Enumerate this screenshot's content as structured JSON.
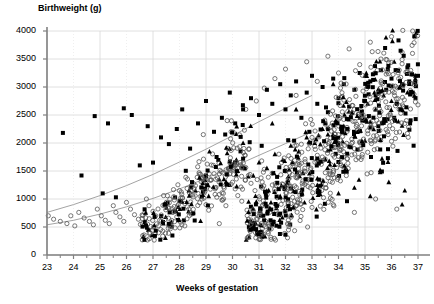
{
  "chart_data": {
    "type": "scatter",
    "title": "",
    "xlabel": "Weeks of gestation",
    "ylabel": "Birthweight (g)",
    "xlim": [
      23,
      37
    ],
    "ylim": [
      0,
      4000
    ],
    "xticks": [
      23,
      24,
      25,
      26,
      27,
      28,
      29,
      30,
      31,
      32,
      33,
      34,
      35,
      36,
      37
    ],
    "yticks": [
      0,
      500,
      1000,
      1500,
      2000,
      2500,
      3000,
      3500,
      4000
    ],
    "grid": true,
    "legend_position": "none",
    "series": [
      {
        "name": "open-circles",
        "marker": "open-circle",
        "color": "#555555",
        "points": [
          [
            23.05,
            700
          ],
          [
            23.25,
            640
          ],
          [
            23.5,
            600
          ],
          [
            23.75,
            560
          ],
          [
            23.9,
            700
          ],
          [
            24.05,
            520
          ],
          [
            24.2,
            760
          ],
          [
            24.4,
            660
          ],
          [
            24.6,
            600
          ],
          [
            24.75,
            540
          ],
          [
            24.9,
            820
          ],
          [
            25.05,
            700
          ],
          [
            25.2,
            620
          ],
          [
            25.35,
            560
          ],
          [
            25.5,
            880
          ],
          [
            25.6,
            760
          ],
          [
            25.75,
            680
          ],
          [
            25.9,
            600
          ],
          [
            26.0,
            940
          ],
          [
            26.15,
            820
          ],
          [
            26.3,
            720
          ],
          [
            26.45,
            640
          ],
          [
            26.6,
            560
          ],
          [
            26.75,
            1000
          ],
          [
            26.85,
            880
          ],
          [
            27.0,
            780
          ],
          [
            27.1,
            700
          ],
          [
            27.25,
            620
          ],
          [
            27.4,
            1060
          ],
          [
            27.5,
            940
          ],
          [
            27.6,
            840
          ],
          [
            27.75,
            760
          ],
          [
            27.9,
            680
          ],
          [
            28.0,
            1150
          ],
          [
            28.1,
            1020
          ],
          [
            28.2,
            920
          ],
          [
            28.35,
            820
          ],
          [
            28.5,
            740
          ],
          [
            28.6,
            1240
          ],
          [
            28.7,
            1100
          ],
          [
            28.85,
            1000
          ],
          [
            29.0,
            900
          ],
          [
            29.1,
            800
          ],
          [
            29.2,
            1340
          ],
          [
            29.35,
            1200
          ],
          [
            29.5,
            1080
          ],
          [
            29.6,
            980
          ],
          [
            29.75,
            880
          ],
          [
            29.9,
            1450
          ],
          [
            30.0,
            1300
          ],
          [
            30.1,
            1180
          ],
          [
            30.2,
            1060
          ],
          [
            30.35,
            960
          ],
          [
            30.5,
            1560
          ],
          [
            30.6,
            1420
          ],
          [
            30.7,
            1280
          ],
          [
            30.85,
            1150
          ],
          [
            31.0,
            1040
          ],
          [
            31.1,
            1680
          ],
          [
            31.2,
            1530
          ],
          [
            31.35,
            1390
          ],
          [
            31.5,
            1250
          ],
          [
            31.6,
            1130
          ],
          [
            31.75,
            1800
          ],
          [
            31.85,
            1650
          ],
          [
            32.0,
            1500
          ],
          [
            32.1,
            1360
          ],
          [
            32.2,
            1230
          ],
          [
            32.35,
            1950
          ],
          [
            32.5,
            1790
          ],
          [
            32.6,
            1640
          ],
          [
            32.75,
            1490
          ],
          [
            32.85,
            1350
          ],
          [
            33.0,
            2100
          ],
          [
            33.1,
            1940
          ],
          [
            33.2,
            1780
          ],
          [
            33.35,
            1620
          ],
          [
            33.5,
            1470
          ],
          [
            33.6,
            2260
          ],
          [
            33.7,
            2090
          ],
          [
            33.85,
            1920
          ],
          [
            34.0,
            1760
          ],
          [
            34.1,
            1600
          ],
          [
            34.2,
            2420
          ],
          [
            34.35,
            2240
          ],
          [
            34.5,
            2070
          ],
          [
            34.6,
            1900
          ],
          [
            34.75,
            1740
          ],
          [
            34.85,
            2580
          ],
          [
            35.0,
            2400
          ],
          [
            35.1,
            2220
          ],
          [
            35.2,
            2050
          ],
          [
            35.35,
            1880
          ],
          [
            35.5,
            2740
          ],
          [
            35.6,
            2560
          ],
          [
            35.7,
            2380
          ],
          [
            35.85,
            2200
          ],
          [
            36.0,
            2030
          ],
          [
            36.1,
            2900
          ],
          [
            36.2,
            2710
          ],
          [
            36.35,
            2530
          ],
          [
            36.5,
            2350
          ],
          [
            36.6,
            2170
          ],
          [
            36.75,
            3060
          ],
          [
            36.85,
            2870
          ],
          [
            37.0,
            2680
          ],
          [
            31.2,
            2980
          ],
          [
            31.6,
            3150
          ],
          [
            32.0,
            3320
          ],
          [
            32.4,
            2850
          ],
          [
            32.8,
            3450
          ],
          [
            33.2,
            3100
          ],
          [
            33.6,
            3550
          ],
          [
            34.0,
            3250
          ],
          [
            34.4,
            3680
          ],
          [
            34.8,
            3400
          ],
          [
            35.2,
            3800
          ],
          [
            35.6,
            3500
          ],
          [
            36.0,
            3900
          ],
          [
            36.4,
            3620
          ],
          [
            36.8,
            4000
          ],
          [
            30.5,
            2600
          ],
          [
            30.9,
            2750
          ],
          [
            29.8,
            2400
          ],
          [
            28.9,
            2150
          ],
          [
            33.0,
            850
          ],
          [
            33.8,
            900
          ],
          [
            34.6,
            760
          ],
          [
            35.4,
            1000
          ],
          [
            36.2,
            820
          ],
          [
            32.2,
            700
          ],
          [
            31.4,
            760
          ],
          [
            30.6,
            640
          ],
          [
            29.5,
            560
          ],
          [
            28.2,
            520
          ]
        ]
      },
      {
        "name": "filled-squares",
        "marker": "filled-square",
        "color": "#000000",
        "points": [
          [
            23.6,
            2180
          ],
          [
            24.3,
            1420
          ],
          [
            24.8,
            2480
          ],
          [
            25.1,
            1100
          ],
          [
            25.3,
            2350
          ],
          [
            25.6,
            1030
          ],
          [
            25.9,
            2620
          ],
          [
            26.2,
            2500
          ],
          [
            26.5,
            1600
          ],
          [
            26.8,
            2300
          ],
          [
            27.0,
            1650
          ],
          [
            27.3,
            2100
          ],
          [
            27.6,
            1980
          ],
          [
            27.9,
            2250
          ],
          [
            28.1,
            2600
          ],
          [
            28.4,
            1900
          ],
          [
            28.7,
            2350
          ],
          [
            29.0,
            2750
          ],
          [
            29.3,
            2200
          ],
          [
            29.6,
            2450
          ],
          [
            29.9,
            2900
          ],
          [
            30.1,
            2350
          ],
          [
            30.4,
            2600
          ],
          [
            30.7,
            2800
          ],
          [
            31.0,
            2500
          ],
          [
            31.3,
            2950
          ],
          [
            31.5,
            2700
          ],
          [
            31.8,
            3050
          ],
          [
            32.0,
            2600
          ],
          [
            32.2,
            2850
          ],
          [
            32.4,
            3100
          ],
          [
            32.6,
            2450
          ],
          [
            32.8,
            2900
          ],
          [
            33.0,
            3200
          ],
          [
            33.2,
            2700
          ],
          [
            33.4,
            3000
          ],
          [
            33.6,
            2550
          ],
          [
            33.8,
            3150
          ],
          [
            34.0,
            2800
          ],
          [
            34.2,
            3050
          ],
          [
            34.4,
            2650
          ],
          [
            34.6,
            2950
          ],
          [
            34.8,
            3250
          ],
          [
            35.0,
            2750
          ],
          [
            35.2,
            3100
          ],
          [
            35.4,
            2850
          ],
          [
            35.6,
            3300
          ],
          [
            35.8,
            2950
          ],
          [
            36.0,
            3150
          ],
          [
            36.2,
            2700
          ],
          [
            36.4,
            3050
          ],
          [
            36.6,
            3350
          ],
          [
            36.8,
            2900
          ],
          [
            37.0,
            3200
          ],
          [
            32.1,
            2050
          ],
          [
            32.9,
            2200
          ],
          [
            33.5,
            2350
          ],
          [
            34.1,
            2250
          ],
          [
            34.9,
            2400
          ],
          [
            35.5,
            2300
          ],
          [
            36.1,
            2450
          ],
          [
            36.7,
            2350
          ],
          [
            31.1,
            1950
          ],
          [
            30.3,
            1850
          ],
          [
            29.4,
            1750
          ]
        ]
      },
      {
        "name": "filled-triangles",
        "marker": "filled-triangle",
        "color": "#000000",
        "points": [
          [
            28.1,
            950
          ],
          [
            28.6,
            1150
          ],
          [
            29.1,
            1050
          ],
          [
            29.5,
            1350
          ],
          [
            29.9,
            1250
          ],
          [
            30.2,
            1500
          ],
          [
            30.6,
            1400
          ],
          [
            31.0,
            1650
          ],
          [
            31.3,
            1550
          ],
          [
            31.6,
            1800
          ],
          [
            31.9,
            1700
          ],
          [
            32.2,
            1950
          ],
          [
            32.5,
            1850
          ],
          [
            32.8,
            2100
          ],
          [
            33.1,
            2000
          ],
          [
            33.4,
            2250
          ],
          [
            33.6,
            2150
          ],
          [
            33.9,
            2400
          ],
          [
            34.2,
            2300
          ],
          [
            34.5,
            2550
          ],
          [
            34.8,
            2450
          ],
          [
            35.1,
            2700
          ],
          [
            35.4,
            2600
          ],
          [
            35.7,
            2850
          ],
          [
            36.0,
            2750
          ],
          [
            36.3,
            3000
          ],
          [
            36.6,
            2900
          ],
          [
            36.9,
            3150
          ],
          [
            34.0,
            1100
          ],
          [
            34.6,
            1200
          ],
          [
            35.2,
            1050
          ],
          [
            35.9,
            1300
          ],
          [
            36.5,
            1150
          ],
          [
            33.2,
            1250
          ],
          [
            32.6,
            1150
          ],
          [
            31.8,
            1050
          ],
          [
            30.9,
            950
          ],
          [
            36.4,
            900
          ],
          [
            35.0,
            3200
          ],
          [
            36.1,
            3450
          ],
          [
            33.8,
            3050
          ],
          [
            32.4,
            2600
          ],
          [
            31.5,
            2350
          ],
          [
            30.4,
            2000
          ]
        ]
      }
    ],
    "reference_curves": [
      {
        "name": "upper-centile-curve",
        "color": "#999999",
        "points": [
          [
            23.0,
            760
          ],
          [
            24.0,
            900
          ],
          [
            25.0,
            1060
          ],
          [
            26.0,
            1240
          ],
          [
            27.0,
            1440
          ],
          [
            28.0,
            1660
          ],
          [
            29.0,
            1890
          ],
          [
            30.0,
            2130
          ],
          [
            31.0,
            2380
          ],
          [
            32.0,
            2620
          ],
          [
            33.0,
            2850
          ]
        ]
      },
      {
        "name": "lower-centile-curve",
        "color": "#999999",
        "points": [
          [
            23.0,
            540
          ],
          [
            24.0,
            620
          ],
          [
            25.0,
            730
          ],
          [
            26.0,
            860
          ],
          [
            27.0,
            1010
          ],
          [
            28.0,
            1180
          ],
          [
            29.0,
            1370
          ],
          [
            30.0,
            1570
          ],
          [
            31.0,
            1780
          ],
          [
            32.0,
            1990
          ],
          [
            33.0,
            2200
          ]
        ]
      }
    ]
  }
}
